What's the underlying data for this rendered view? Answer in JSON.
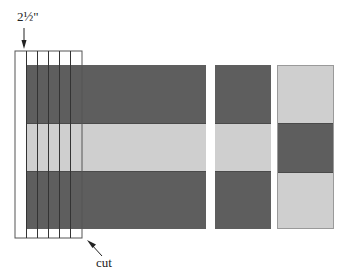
{
  "diagram": {
    "colors": {
      "dark_fabric": "#5e5e5e",
      "light_fabric": "#cfcfcf",
      "outline": "#555555",
      "background": "#ffffff"
    },
    "labels": {
      "strip_width": "2½\"",
      "cut": "cut"
    },
    "pieced_block": {
      "bands": [
        "dark",
        "light",
        "dark"
      ],
      "strip_count": 6,
      "strip_width_label": "2½\""
    },
    "panels": [
      {
        "name": "panel-a",
        "bands": [
          "dark",
          "light",
          "dark"
        ]
      },
      {
        "name": "panel-b",
        "bands": [
          "light",
          "dark",
          "light"
        ]
      }
    ]
  }
}
